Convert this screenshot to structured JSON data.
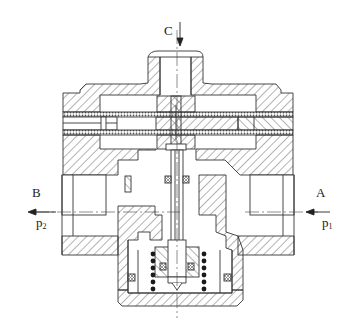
{
  "figure": {
    "type": "engineering cross-section drawing",
    "colors": {
      "line": "#333333",
      "background": "#ffffff",
      "spring_coil": "#1a1a1a",
      "diaphragm_mesh": "#555555"
    }
  },
  "labels": {
    "top_port": "C",
    "left_port": "B",
    "right_port": "A",
    "left_pressure_base": "p",
    "left_pressure_sub": "2",
    "right_pressure_base": "p",
    "right_pressure_sub": "1"
  },
  "arrows": {
    "top": "inlet arrow pointing down into port C",
    "left": "outlet arrow pointing left out of port B",
    "right": "inlet arrow pointing left into port A"
  },
  "components": [
    "top-cap",
    "upper-diaphragm",
    "lower-diaphragm",
    "center-stem",
    "valve-body",
    "inlet-channel-a",
    "outlet-channel-b",
    "bottom-cap",
    "spring-left",
    "spring-right",
    "o-rings"
  ]
}
